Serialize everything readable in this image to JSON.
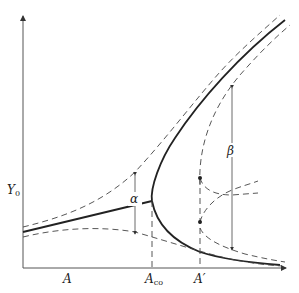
{
  "diagram": {
    "y_axis_label": "Y",
    "y_axis_label_sub": "0",
    "x_axis_ticks": [
      {
        "name": "A",
        "label": "A",
        "sub": ""
      },
      {
        "name": "A-co",
        "label": "A",
        "sub": "co"
      },
      {
        "name": "A-prime",
        "label": "A′",
        "sub": ""
      }
    ],
    "annotations": {
      "alpha": "α",
      "beta": "β"
    },
    "curves": [
      "mean-branch-before-bifurcation",
      "upper-stable-branch",
      "lower-stable-branch",
      "upper-envelope-dashed",
      "lower-envelope-dashed",
      "branch-envelopes-dashed",
      "transition-trajectories-dashed"
    ]
  }
}
